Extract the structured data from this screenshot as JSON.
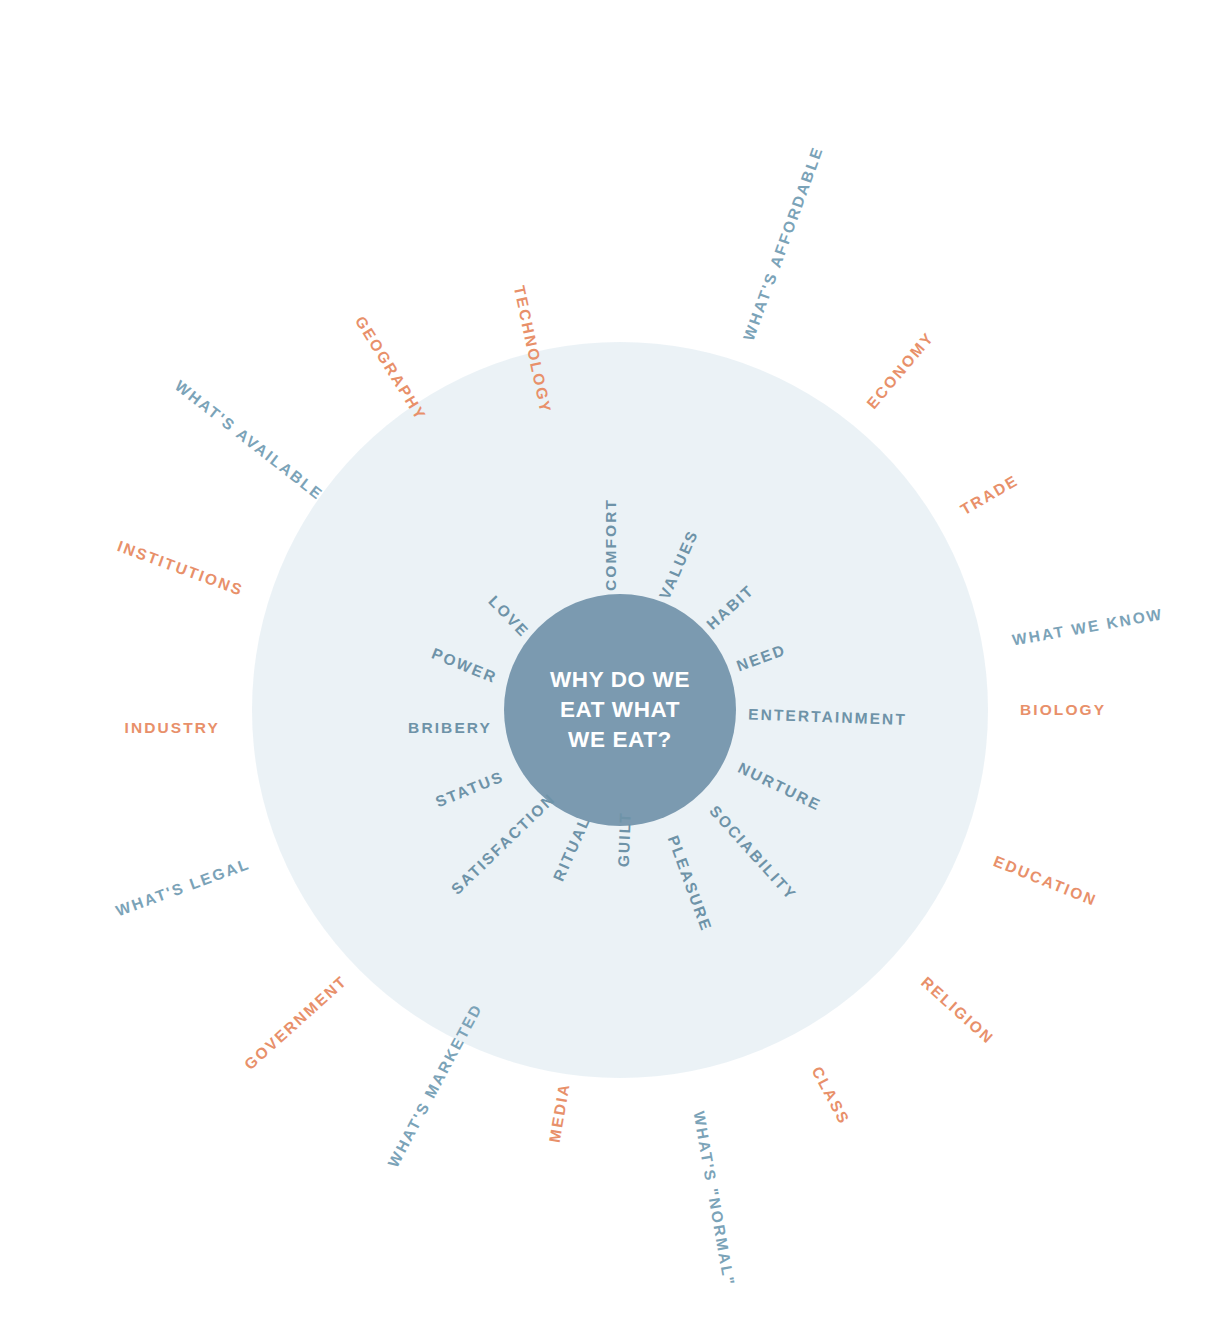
{
  "diagram": {
    "type": "radial-word-wheel",
    "center": {
      "text": "WHY DO WE\nEAT WHAT\nWE EAT?",
      "fill": "#7b9ab0",
      "text_color": "#ffffff"
    },
    "disc": {
      "fill": "#e9f1f5"
    },
    "colors": {
      "inner_text": "#6e93a8",
      "outer_blue": "#7ba3b8",
      "outer_coral": "#e8906a",
      "background": "#ffffff"
    },
    "inner_ring": {
      "count": 15,
      "radius_px": 128,
      "items": [
        {
          "label": "COMFORT",
          "angle": -90
        },
        {
          "label": "VALUES",
          "angle": -66
        },
        {
          "label": "HABIT",
          "angle": -42
        },
        {
          "label": "NEED",
          "angle": -20
        },
        {
          "label": "ENTERTAINMENT",
          "angle": 2
        },
        {
          "label": "NURTURE",
          "angle": 26
        },
        {
          "label": "SOCIABILITY",
          "angle": 48
        },
        {
          "label": "PLEASURE",
          "angle": 70
        },
        {
          "label": "GUILT",
          "angle": 92
        },
        {
          "label": "RITUAL",
          "angle": 114
        },
        {
          "label": "SATISFACTION",
          "angle": 136
        },
        {
          "label": "STATUS",
          "angle": 158
        },
        {
          "label": "BRIBERY",
          "angle": 180
        },
        {
          "label": "POWER",
          "angle": 202
        },
        {
          "label": "LOVE",
          "angle": 226
        }
      ]
    },
    "outer_ring": {
      "count": 18,
      "radius_px": 400,
      "items": [
        {
          "label": "WHAT'S AFFORDABLE",
          "angle": -70,
          "color": "blue"
        },
        {
          "label": "ECONOMY",
          "angle": -50,
          "color": "coral"
        },
        {
          "label": "TRADE",
          "angle": -30,
          "color": "coral"
        },
        {
          "label": "WHAT WE KNOW",
          "angle": -10,
          "color": "blue"
        },
        {
          "label": "BIOLOGY",
          "angle": 0,
          "color": "coral"
        },
        {
          "label": "EDUCATION",
          "angle": 22,
          "color": "coral"
        },
        {
          "label": "RELIGION",
          "angle": 42,
          "color": "coral"
        },
        {
          "label": "CLASS",
          "angle": 62,
          "color": "coral"
        },
        {
          "label": "WHAT'S \"NORMAL\"",
          "angle": 80,
          "color": "blue"
        },
        {
          "label": "MEDIA",
          "angle": 100,
          "color": "coral"
        },
        {
          "label": "WHAT'S MARKETED",
          "angle": 118,
          "color": "blue"
        },
        {
          "label": "GOVERNMENT",
          "angle": 138,
          "color": "coral"
        },
        {
          "label": "WHAT'S LEGAL",
          "angle": 160,
          "color": "blue"
        },
        {
          "label": "INDUSTRY",
          "angle": 180,
          "color": "coral"
        },
        {
          "label": "INSTITUTIONS",
          "angle": 200,
          "color": "coral"
        },
        {
          "label": "WHAT'S AVAILABLE",
          "angle": 218,
          "color": "blue"
        },
        {
          "label": "GEOGRAPHY",
          "angle": 238,
          "color": "coral"
        },
        {
          "label": "TECHNOLOGY",
          "angle": 258,
          "color": "coral"
        }
      ]
    }
  }
}
